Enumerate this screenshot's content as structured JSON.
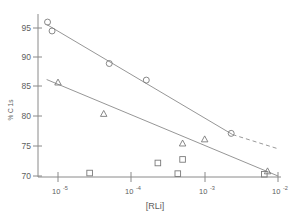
{
  "chart_data": {
    "type": "scatter",
    "title": "",
    "xlabel": "[RLi]",
    "ylabel": "% C 1s",
    "xscale": "log",
    "xlim": [
      7e-06,
      0.01
    ],
    "ylim": [
      69.5,
      96.5
    ],
    "grid": false,
    "legend": "none",
    "x_tick_labels": [
      "10-5",
      "10-4",
      "10-3",
      "10-2"
    ],
    "x_tick_values": [
      1e-05,
      0.0001,
      0.001,
      0.01
    ],
    "y_tick_labels": [
      "95",
      "90",
      "85",
      "80",
      "75",
      "70"
    ],
    "y_tick_values": [
      95,
      90,
      85,
      80,
      75,
      70
    ],
    "series": [
      {
        "name": "circles",
        "marker": "circle",
        "points": [
          {
            "x": 7.2e-06,
            "y": 96.0
          },
          {
            "x": 8.3e-06,
            "y": 94.5
          },
          {
            "x": 5e-05,
            "y": 89.0
          },
          {
            "x": 0.00016,
            "y": 86.2
          },
          {
            "x": 0.0023,
            "y": 77.2
          }
        ],
        "fit_line": {
          "x0": 7e-06,
          "y0": 95.6,
          "x1": 0.0024,
          "y1": 77.0
        },
        "fit_line_dashed": {
          "x0": 0.0024,
          "y0": 77.0,
          "x1": 0.01,
          "y1": 74.6
        }
      },
      {
        "name": "triangles",
        "marker": "triangle",
        "points": [
          {
            "x": 1e-05,
            "y": 85.8
          },
          {
            "x": 4.2e-05,
            "y": 80.5
          },
          {
            "x": 0.0005,
            "y": 75.5
          },
          {
            "x": 0.001,
            "y": 76.2
          },
          {
            "x": 0.0072,
            "y": 70.8
          }
        ],
        "fit_line": {
          "x0": 7e-06,
          "y0": 86.3,
          "x1": 0.01,
          "y1": 70.0
        }
      },
      {
        "name": "squares",
        "marker": "square",
        "points": [
          {
            "x": 2.7e-05,
            "y": 70.5
          },
          {
            "x": 0.00023,
            "y": 72.2
          },
          {
            "x": 0.00043,
            "y": 70.4
          },
          {
            "x": 0.0005,
            "y": 72.8
          },
          {
            "x": 0.0065,
            "y": 70.3
          }
        ]
      }
    ]
  },
  "axes": {
    "y_label_text": "% C 1s",
    "x_label_text": "[RLi]",
    "y_ticks": [
      {
        "label": "95"
      },
      {
        "label": "90"
      },
      {
        "label": "85"
      },
      {
        "label": "80"
      },
      {
        "label": "75"
      },
      {
        "label": "70"
      }
    ],
    "x_ticks": [
      {
        "base": "10",
        "exp": "-5"
      },
      {
        "base": "10",
        "exp": "-4"
      },
      {
        "base": "10",
        "exp": "-3"
      },
      {
        "base": "10",
        "exp": "-2"
      }
    ]
  },
  "colors": {
    "axis": "#8a8a8a",
    "marker": "#7a7a7a",
    "line": "#8a8a8a",
    "text": "#5e5e5e",
    "background": "#ffffff"
  }
}
